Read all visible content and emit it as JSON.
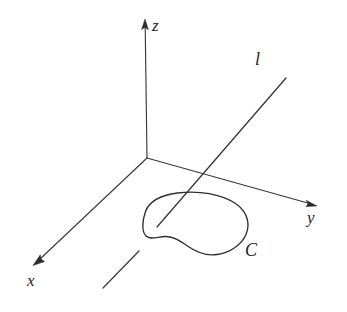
{
  "figure": {
    "kind": "math-diagram",
    "background_color": "#ffffff",
    "ink_color": "#2f2f2f",
    "canvas": {
      "width": 347,
      "height": 312
    },
    "origin": {
      "x": 147,
      "y": 158
    },
    "axes": [
      {
        "name": "z",
        "label": "z",
        "from": {
          "x": 147,
          "y": 158
        },
        "to": {
          "x": 145,
          "y": 22
        },
        "has_arrow": true,
        "label_position": {
          "x": 152,
          "y": 17
        }
      },
      {
        "name": "x",
        "label": "x",
        "from": {
          "x": 147,
          "y": 158
        },
        "to": {
          "x": 34,
          "y": 265
        },
        "has_arrow": true,
        "label_position": {
          "x": 27,
          "y": 272
        }
      },
      {
        "name": "y",
        "label": "y",
        "from": {
          "x": 147,
          "y": 158
        },
        "to": {
          "x": 316,
          "y": 206
        },
        "has_arrow": true,
        "label_position": {
          "x": 307,
          "y": 209
        }
      }
    ],
    "line": {
      "name": "l",
      "label": "l",
      "from": {
        "x": 157,
        "y": 227
      },
      "to": {
        "x": 286,
        "y": 78
      },
      "has_arrow": false,
      "label_position": {
        "x": 255,
        "y": 50
      }
    },
    "curve": {
      "name": "C",
      "label": "C",
      "closed": true,
      "label_position": {
        "x": 245,
        "y": 241
      },
      "bounds": {
        "left": 143,
        "top": 192,
        "right": 248,
        "bottom": 256
      }
    },
    "tick_segment": {
      "name": "axis-tick-mark",
      "from": {
        "x": 103,
        "y": 288
      },
      "to": {
        "x": 139,
        "y": 251
      }
    }
  },
  "labels": {
    "z": "z",
    "x": "x",
    "y": "y",
    "l": "l",
    "c": "C"
  }
}
